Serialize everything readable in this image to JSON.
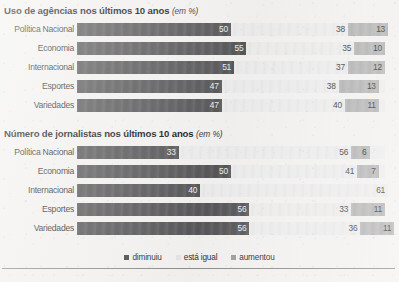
{
  "legend": {
    "items": [
      {
        "label": "diminuiu",
        "key": "diminuiu",
        "color": "#4e4e50"
      },
      {
        "label": "está igual",
        "key": "esta_igual",
        "color": "#e6e6e6"
      },
      {
        "label": "aumentou",
        "key": "aumentou",
        "color": "#9f9f9f"
      }
    ]
  },
  "colors": {
    "diminuiu": "#58585a",
    "esta_igual": "#eeeeee",
    "aumentou": "#b5b5b5",
    "page_background": "#f4f3f1",
    "rule": "#8e8e8e",
    "title_text": "#171717"
  },
  "charts": [
    {
      "title": "Uso de agências nos últimos 10 anos",
      "unit": "(em %)",
      "rows": [
        {
          "label": "Política Nacional",
          "diminuiu": "50",
          "esta_igual": "38",
          "aumentou": "13"
        },
        {
          "label": "Economia",
          "diminuiu": "55",
          "esta_igual": "35",
          "aumentou": "10"
        },
        {
          "label": "Internacional",
          "diminuiu": "51",
          "esta_igual": "37",
          "aumentou": "12"
        },
        {
          "label": "Esportes",
          "diminuiu": "47",
          "esta_igual": "38",
          "aumentou": "13"
        },
        {
          "label": "Variedades",
          "diminuiu": "47",
          "esta_igual": "40",
          "aumentou": "11"
        }
      ]
    },
    {
      "title": "Número de jornalistas nos últimos 10 anos",
      "unit": "(em %)",
      "rows": [
        {
          "label": "Política Nacional",
          "diminuiu": "33",
          "esta_igual": "56",
          "aumentou": "6"
        },
        {
          "label": "Economia",
          "diminuiu": "50",
          "esta_igual": "41",
          "aumentou": "7"
        },
        {
          "label": "Internacional",
          "diminuiu": "40",
          "esta_igual": "61",
          "aumentou": ""
        },
        {
          "label": "Esportes",
          "diminuiu": "56",
          "esta_igual": "33",
          "aumentou": "11"
        },
        {
          "label": "Variedades",
          "diminuiu": "56",
          "esta_igual": "36",
          "aumentou": "11"
        }
      ]
    }
  ],
  "chart_data": [
    {
      "type": "bar",
      "orientation": "horizontal",
      "stacked": true,
      "normalized_percent": true,
      "title": "Uso de agências nos últimos 10 anos (em %)",
      "xlabel": "",
      "ylabel": "",
      "xlim": [
        0,
        101
      ],
      "grid": false,
      "legend_position": "bottom-center",
      "categories": [
        "Política Nacional",
        "Economia",
        "Internacional",
        "Esportes",
        "Variedades"
      ],
      "series": [
        {
          "name": "diminuiu",
          "values": [
            50,
            55,
            51,
            47,
            47
          ]
        },
        {
          "name": "está igual",
          "values": [
            38,
            35,
            37,
            38,
            40
          ]
        },
        {
          "name": "aumentou",
          "values": [
            13,
            10,
            12,
            13,
            11
          ]
        }
      ]
    },
    {
      "type": "bar",
      "orientation": "horizontal",
      "stacked": true,
      "normalized_percent": true,
      "title": "Número de jornalistas nos últimos 10 anos (em %)",
      "xlabel": "",
      "ylabel": "",
      "xlim": [
        0,
        101
      ],
      "grid": false,
      "legend_position": "bottom-center",
      "categories": [
        "Política Nacional",
        "Economia",
        "Internacional",
        "Esportes",
        "Variedades"
      ],
      "series": [
        {
          "name": "diminuiu",
          "values": [
            33,
            50,
            40,
            56,
            56
          ]
        },
        {
          "name": "está igual",
          "values": [
            56,
            41,
            61,
            33,
            36
          ]
        },
        {
          "name": "aumentou",
          "values": [
            6,
            7,
            null,
            11,
            11
          ]
        }
      ]
    }
  ]
}
